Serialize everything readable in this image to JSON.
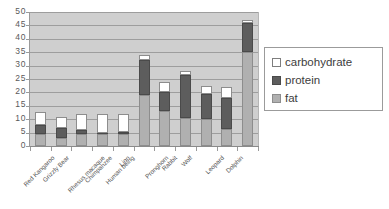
{
  "chart_data": {
    "type": "bar",
    "subtype": "stacked",
    "title": "",
    "xlabel": "",
    "ylabel": "",
    "ylim": [
      0,
      50
    ],
    "ytick_step": 5,
    "ytick_labels": [
      "50",
      "45",
      "40",
      "35",
      "30",
      "25",
      "20",
      "15",
      "10",
      "5",
      "0"
    ],
    "grid": true,
    "legend_position": "right",
    "categories": [
      "Red Kangaroo",
      "Grizzly Bear",
      "Rhesus macaque",
      "Chimpanzee",
      "Human being",
      "Lion",
      "Pronghorn",
      "Rabbit",
      "Wolf",
      "Leopard",
      "Dolphin"
    ],
    "series": [
      {
        "name": "fat",
        "color": "#b0b0b0",
        "values": [
          4.5,
          3.0,
          4.3,
          4.3,
          4.5,
          19.0,
          13.0,
          10.5,
          10.0,
          6.5,
          35.0
        ]
      },
      {
        "name": "protein",
        "color": "#5d5d5d",
        "values": [
          3.5,
          3.8,
          1.7,
          0.7,
          0.8,
          13.0,
          7.2,
          16.0,
          9.5,
          11.5,
          11.0
        ]
      },
      {
        "name": "carbohydrate",
        "color": "#ffffff",
        "values": [
          4.8,
          4.2,
          6.0,
          7.0,
          6.7,
          2.0,
          3.8,
          1.5,
          3.0,
          4.0,
          1.0
        ]
      }
    ],
    "totals": [
      12.8,
      11.0,
      12.0,
      12.0,
      12.0,
      34.0,
      24.0,
      28.0,
      22.5,
      22.0,
      47.0
    ]
  },
  "legend": {
    "entries": [
      {
        "label": "carbohydrate",
        "swatch": "legend-swatch-carbohydrate"
      },
      {
        "label": "protein",
        "swatch": "legend-swatch-protein"
      },
      {
        "label": "fat",
        "swatch": "legend-swatch-fat"
      }
    ]
  },
  "colors": {
    "plot_background": "#cfcfcf",
    "gridline": "#9d9d9d",
    "axis": "#8a8a8a",
    "fat": "#b0b0b0",
    "protein": "#5d5d5d",
    "carbohydrate": "#ffffff"
  }
}
